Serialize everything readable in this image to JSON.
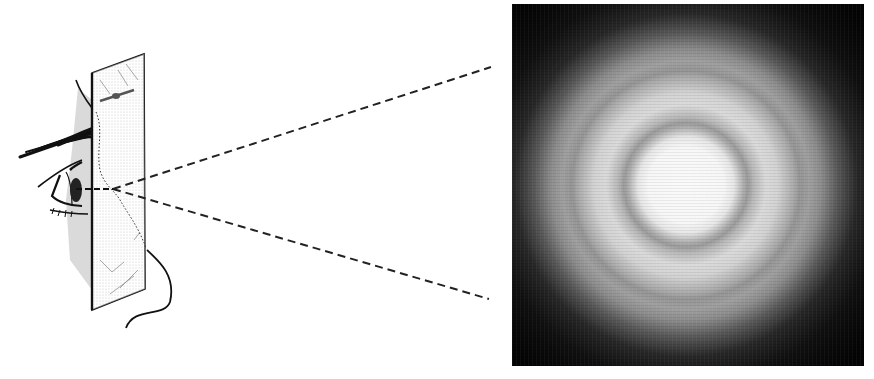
{
  "figure": {
    "colors": {
      "ink": "#111111",
      "paper": "#ffffff",
      "plate_fill": "#e9e9e9",
      "photo_background": "#0a0a0a",
      "photo_center": "#f4f4f4"
    },
    "illustration": {
      "plate": {
        "tl": [
          92,
          73
        ],
        "tr": [
          144,
          54
        ],
        "br": [
          145,
          289
        ],
        "bl": [
          92,
          310
        ]
      },
      "convergence_point": [
        113,
        189
      ],
      "dashed_rays": [
        {
          "from": [
            113,
            189
          ],
          "to": [
            491,
            67
          ]
        },
        {
          "from": [
            113,
            189
          ],
          "to": [
            489,
            299
          ]
        }
      ]
    },
    "photo": {
      "x": 512,
      "y": 4,
      "width": 352,
      "height": 362,
      "ring_center": [
        686,
        185
      ],
      "rings": [
        {
          "type": "bright-disk",
          "radius": 48
        },
        {
          "type": "dark-ring",
          "radius": 60
        },
        {
          "type": "bright-ring",
          "radius": 82
        },
        {
          "type": "dark-ring",
          "radius": 112
        },
        {
          "type": "faint-bright-ring",
          "radius": 126
        }
      ]
    }
  }
}
